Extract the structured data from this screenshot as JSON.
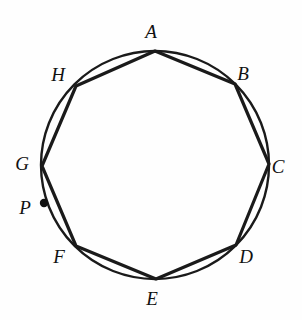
{
  "figure": {
    "type": "geometry-diagram",
    "stroke_color": "#1a1a1a",
    "background_color": "#fefefe",
    "circle": {
      "cx": 155,
      "cy": 165,
      "r": 114,
      "stroke_width": 2.4
    },
    "polygon": {
      "sides": 8,
      "stroke_width": 3.2
    },
    "point_marker": {
      "r": 4.2,
      "fill": "#111111"
    },
    "vertices": [
      {
        "id": "A",
        "label": "A",
        "x": 155,
        "y": 51,
        "label_x": 151,
        "label_y": 31
      },
      {
        "id": "B",
        "label": "B",
        "x": 235,
        "y": 84,
        "label_x": 243,
        "label_y": 73
      },
      {
        "id": "C",
        "label": "C",
        "x": 269,
        "y": 164,
        "label_x": 278,
        "label_y": 166
      },
      {
        "id": "D",
        "label": "D",
        "x": 236,
        "y": 245,
        "label_x": 246,
        "label_y": 256
      },
      {
        "id": "E",
        "label": "E",
        "x": 156,
        "y": 279,
        "label_x": 152,
        "label_y": 298
      },
      {
        "id": "F",
        "label": "F",
        "x": 76,
        "y": 246,
        "label_x": 59,
        "label_y": 256
      },
      {
        "id": "G",
        "label": "G",
        "x": 42,
        "y": 166,
        "label_x": 22,
        "label_y": 163
      },
      {
        "id": "H",
        "label": "H",
        "x": 76,
        "y": 86,
        "label_x": 58,
        "label_y": 74
      }
    ],
    "marked_point": {
      "id": "P",
      "label": "P",
      "x": 44,
      "y": 203,
      "label_x": 25,
      "label_y": 207,
      "on": "arc-G-F"
    }
  }
}
